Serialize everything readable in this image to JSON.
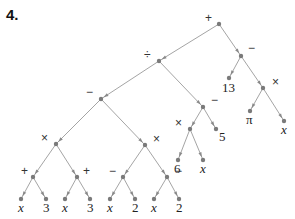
{
  "problem_number": "4.",
  "tree": {
    "nodes": [
      {
        "id": "root",
        "label": "+",
        "x": 219,
        "y": 24,
        "lx": -14,
        "ly": -2,
        "kind": "op"
      },
      {
        "id": "div",
        "label": "÷",
        "x": 159,
        "y": 61,
        "lx": -15,
        "ly": -2,
        "kind": "op"
      },
      {
        "id": "sub_r",
        "label": "−",
        "x": 241,
        "y": 56,
        "lx": 7,
        "ly": -4,
        "kind": "op"
      },
      {
        "id": "n13",
        "label": "13",
        "x": 229,
        "y": 78,
        "lx": -7,
        "ly": 14,
        "kind": "leaf"
      },
      {
        "id": "mul_r",
        "label": "×",
        "x": 263,
        "y": 88,
        "lx": 9,
        "ly": -2,
        "kind": "op"
      },
      {
        "id": "pi",
        "label": "π",
        "x": 250,
        "y": 111,
        "lx": -4,
        "ly": 13,
        "kind": "leaf"
      },
      {
        "id": "xr",
        "label": "x",
        "x": 284,
        "y": 121,
        "lx": -3,
        "ly": 13,
        "kind": "leafi"
      },
      {
        "id": "sub_l",
        "label": "−",
        "x": 101,
        "y": 99,
        "lx": -15,
        "ly": -3,
        "kind": "op"
      },
      {
        "id": "sub_m",
        "label": "−",
        "x": 203,
        "y": 107,
        "lx": 8,
        "ly": -3,
        "kind": "op"
      },
      {
        "id": "mul_m",
        "label": "×",
        "x": 190,
        "y": 129,
        "lx": -15,
        "ly": -2,
        "kind": "op"
      },
      {
        "id": "n5",
        "label": "5",
        "x": 216,
        "y": 129,
        "lx": 3,
        "ly": 12,
        "kind": "leaf"
      },
      {
        "id": "n6",
        "label": "6",
        "x": 178,
        "y": 160,
        "lx": -4,
        "ly": 13,
        "kind": "leaf"
      },
      {
        "id": "xm",
        "label": "x",
        "x": 203,
        "y": 160,
        "lx": -3,
        "ly": 13,
        "kind": "leafi"
      },
      {
        "id": "mul_l",
        "label": "×",
        "x": 56,
        "y": 144,
        "lx": -15,
        "ly": -2,
        "kind": "op"
      },
      {
        "id": "mul_c",
        "label": "×",
        "x": 145,
        "y": 145,
        "lx": 8,
        "ly": -2,
        "kind": "op"
      },
      {
        "id": "add1",
        "label": "+",
        "x": 33,
        "y": 177,
        "lx": -12,
        "ly": -2,
        "kind": "op"
      },
      {
        "id": "add2",
        "label": "+",
        "x": 77,
        "y": 177,
        "lx": 6,
        "ly": -2,
        "kind": "op"
      },
      {
        "id": "sub3",
        "label": "−",
        "x": 123,
        "y": 177,
        "lx": -14,
        "ly": -2,
        "kind": "op"
      },
      {
        "id": "sub4",
        "label": "−",
        "x": 167,
        "y": 177,
        "lx": 8,
        "ly": -2,
        "kind": "op"
      },
      {
        "id": "x1",
        "label": "x",
        "x": 21,
        "y": 199,
        "lx": -3,
        "ly": 13,
        "kind": "leafi"
      },
      {
        "id": "t1",
        "label": "3",
        "x": 46,
        "y": 199,
        "lx": -3,
        "ly": 13,
        "kind": "leaf"
      },
      {
        "id": "x2",
        "label": "x",
        "x": 65,
        "y": 199,
        "lx": -3,
        "ly": 13,
        "kind": "leafi"
      },
      {
        "id": "t2",
        "label": "3",
        "x": 90,
        "y": 199,
        "lx": -3,
        "ly": 13,
        "kind": "leaf"
      },
      {
        "id": "x3",
        "label": "x",
        "x": 110,
        "y": 199,
        "lx": -3,
        "ly": 13,
        "kind": "leafi"
      },
      {
        "id": "w1",
        "label": "2",
        "x": 135,
        "y": 199,
        "lx": -3,
        "ly": 13,
        "kind": "leaf"
      },
      {
        "id": "x4",
        "label": "x",
        "x": 154,
        "y": 199,
        "lx": -3,
        "ly": 13,
        "kind": "leafi"
      },
      {
        "id": "w2",
        "label": "2",
        "x": 179,
        "y": 199,
        "lx": -3,
        "ly": 13,
        "kind": "leaf"
      }
    ],
    "edges": [
      [
        "root",
        "div"
      ],
      [
        "root",
        "sub_r"
      ],
      [
        "sub_r",
        "n13"
      ],
      [
        "sub_r",
        "mul_r"
      ],
      [
        "mul_r",
        "pi"
      ],
      [
        "mul_r",
        "xr"
      ],
      [
        "div",
        "sub_l"
      ],
      [
        "div",
        "sub_m"
      ],
      [
        "sub_m",
        "mul_m"
      ],
      [
        "sub_m",
        "n5"
      ],
      [
        "mul_m",
        "n6"
      ],
      [
        "mul_m",
        "xm"
      ],
      [
        "sub_l",
        "mul_l"
      ],
      [
        "sub_l",
        "mul_c"
      ],
      [
        "mul_l",
        "add1"
      ],
      [
        "mul_l",
        "add2"
      ],
      [
        "mul_c",
        "sub3"
      ],
      [
        "mul_c",
        "sub4"
      ],
      [
        "add1",
        "x1"
      ],
      [
        "add1",
        "t1"
      ],
      [
        "add2",
        "x2"
      ],
      [
        "add2",
        "t2"
      ],
      [
        "sub3",
        "x3"
      ],
      [
        "sub3",
        "w1"
      ],
      [
        "sub4",
        "x4"
      ],
      [
        "sub4",
        "w2"
      ]
    ]
  }
}
